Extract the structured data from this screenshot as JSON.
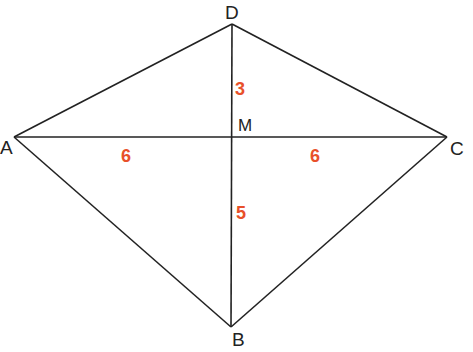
{
  "diagram": {
    "type": "kite-with-diagonals",
    "colors": {
      "line": "#222222",
      "length_label": "#e8502a",
      "background": "#ffffff"
    },
    "vertices": {
      "A": {
        "label": "A",
        "x": 14,
        "y": 137
      },
      "B": {
        "label": "B",
        "x": 231,
        "y": 327
      },
      "C": {
        "label": "C",
        "x": 447,
        "y": 137
      },
      "D": {
        "label": "D",
        "x": 232,
        "y": 24
      },
      "M": {
        "label": "M",
        "x": 232,
        "y": 137
      }
    },
    "segment_lengths": {
      "DM": "3",
      "AM": "6",
      "MC": "6",
      "MB": "5"
    }
  }
}
